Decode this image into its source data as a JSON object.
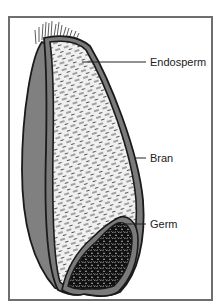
{
  "diagram": {
    "labels": [
      {
        "id": "endosperm",
        "text": "Endosperm"
      },
      {
        "id": "bran",
        "text": "Bran"
      },
      {
        "id": "germ",
        "text": "Germ"
      }
    ],
    "colors": {
      "outline": "#1a1a1a",
      "bran_gray": "#7a7a7a",
      "husk_gray": "#808080",
      "endosperm_fill": "#f0f0f0",
      "germ_fill": "#111111",
      "frame": "#6e6e6e"
    }
  }
}
